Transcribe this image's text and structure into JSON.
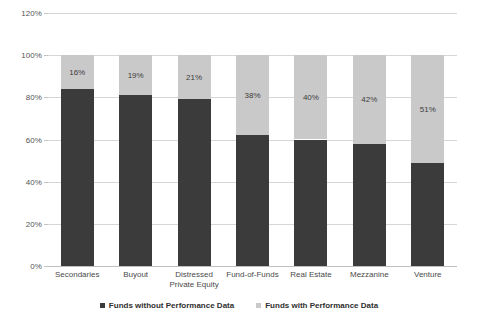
{
  "chart_data": {
    "type": "bar",
    "subtype": "stacked-bar-100",
    "title": "",
    "subtitle": "",
    "xlabel": "",
    "ylabel": "",
    "ylim": [
      0,
      120
    ],
    "ytick_labels": [
      "0%",
      "20%",
      "40%",
      "60%",
      "80%",
      "100%",
      "120%"
    ],
    "ytick_values": [
      0,
      20,
      40,
      60,
      80,
      100,
      120
    ],
    "grid": true,
    "legend_position": "bottom",
    "categories": [
      "Secondaries",
      "Buyout",
      "Distressed\nPrivate Equity",
      "Fund-of-Funds",
      "Real Estate",
      "Mezzanine",
      "Venture"
    ],
    "series": [
      {
        "name": "Funds without Performance Data",
        "color": "#3b3b3b",
        "values": [
          84,
          81,
          79,
          62,
          60,
          58,
          49
        ],
        "labels": [
          "",
          "",
          "",
          "",
          "",
          "",
          ""
        ]
      },
      {
        "name": "Funds with Performance Data",
        "color": "#c9c9c9",
        "values": [
          16,
          19,
          21,
          38,
          40,
          42,
          51
        ],
        "labels": [
          "16%",
          "19%",
          "21%",
          "38%",
          "40%",
          "42%",
          "51%"
        ]
      }
    ]
  },
  "legend": {
    "items": [
      {
        "label": "Funds without Performance Data",
        "color": "#3b3b3b"
      },
      {
        "label": "Funds with Performance Data",
        "color": "#c9c9c9"
      }
    ]
  },
  "colors": {
    "dark_series": "#3b3b3b",
    "light_series": "#c9c9c9",
    "gridline": "#d6d6d6",
    "axis": "#bfbfbf",
    "text": "#404040",
    "background": "#ffffff"
  }
}
